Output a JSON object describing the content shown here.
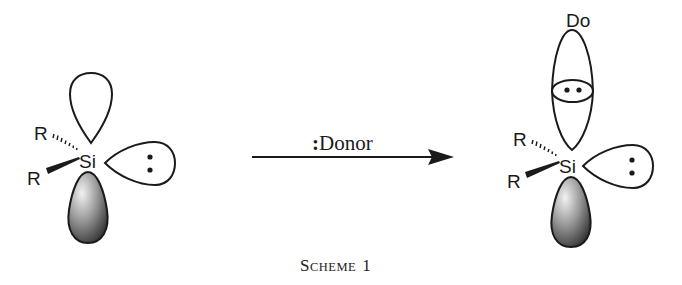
{
  "scheme": {
    "caption_first": "S",
    "caption_smallcaps": "CHEME",
    "caption_number": "1"
  },
  "reactant": {
    "central_atom": "Si",
    "substituent_top": "R",
    "substituent_bottom": "R",
    "lone_pair": ":",
    "orbitals": [
      "empty-p-orbital-top",
      "lone-pair-orbital-right",
      "filled-p-orbital-bottom"
    ]
  },
  "arrow": {
    "reagent_prefix": ":",
    "reagent_label": "Donor"
  },
  "product": {
    "central_atom": "Si",
    "substituent_top": "R",
    "substituent_bottom": "R",
    "donor_label": "Do",
    "donor_lone_pair": "••",
    "lone_pair": ":",
    "orbitals": [
      "donor-orbital",
      "coordination-overlap",
      "lone-pair-orbital-right",
      "filled-p-orbital-bottom"
    ]
  },
  "colors": {
    "ink": "#1a1a1a",
    "shade_dark": "#2b2b2b",
    "shade_light": "#e8e8e8",
    "background": "#ffffff"
  }
}
